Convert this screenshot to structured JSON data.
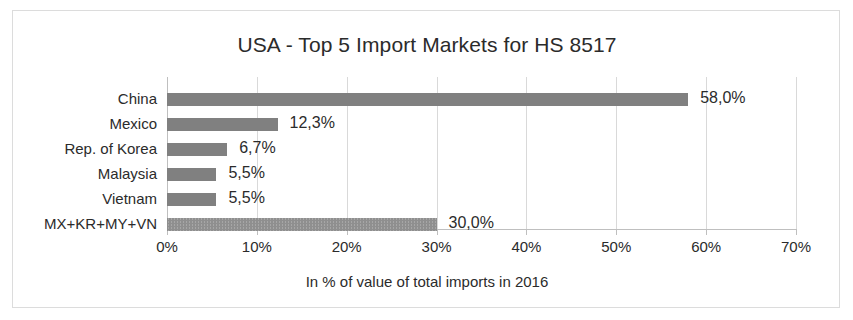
{
  "chart_data": {
    "type": "bar",
    "orientation": "horizontal",
    "title": "USA - Top 5 Import Markets for HS 8517",
    "xlabel": "In % of value of total imports in 2016",
    "ylabel": "",
    "xlim": [
      0,
      70
    ],
    "xticks": [
      "0%",
      "10%",
      "20%",
      "30%",
      "40%",
      "50%",
      "60%",
      "70%"
    ],
    "xtick_values": [
      0,
      10,
      20,
      30,
      40,
      50,
      60,
      70
    ],
    "grid": true,
    "legend": "none",
    "categories": [
      "China",
      "Mexico",
      "Rep. of Korea",
      "Malaysia",
      "Vietnam",
      "MX+KR+MY+VN"
    ],
    "values": [
      58.0,
      12.3,
      6.7,
      5.5,
      5.5,
      30.0
    ],
    "data_labels": [
      "58,0%",
      "12,3%",
      "6,7%",
      "5,5%",
      "5,5%",
      "30,0%"
    ],
    "bar_styles": [
      "solid",
      "solid",
      "solid",
      "solid",
      "solid",
      "hatched"
    ],
    "colors": {
      "bar": "#808080",
      "bar_hatched": "#a6a6a6",
      "gridline": "#d9d9d9",
      "axis": "#bfbfbf",
      "text": "#2b2b2b",
      "frame_border": "#dcdcdc",
      "background": "#ffffff"
    }
  }
}
